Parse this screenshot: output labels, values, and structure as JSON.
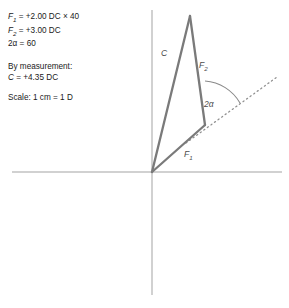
{
  "annotations": {
    "formulas": [
      {
        "id": "f1",
        "symbol": "F",
        "sub": "1",
        "text": " = +2.00 DC × 40"
      },
      {
        "id": "f2",
        "symbol": "F",
        "sub": "2",
        "text": " = +3.00 DC"
      },
      {
        "id": "twoalpha",
        "symbol": "2α",
        "sub": "",
        "text": " = 60"
      }
    ],
    "measurement": {
      "heading": "By measurement:",
      "symbol": "C",
      "text": " = +4.35 DC"
    },
    "scale": "Scale: 1 cm = 1 D"
  },
  "diagram": {
    "type": "vector-triangle",
    "labels": {
      "c": {
        "text": "C",
        "sub": "",
        "x": 161,
        "y": 56
      },
      "f2": {
        "text": "F",
        "sub": "2",
        "x": 199,
        "y": 68
      },
      "f1": {
        "text": "F",
        "sub": "1",
        "x": 184,
        "y": 157
      },
      "angle": {
        "text": "2α",
        "sub": "",
        "x": 204,
        "y": 107
      }
    },
    "axes": {
      "horizontal": {
        "x1": 12,
        "y1": 172,
        "x2": 282,
        "y2": 172
      },
      "vertical": {
        "x1": 152,
        "y1": 10,
        "x2": 152,
        "y2": 295
      },
      "color": "#a0a0a0"
    },
    "vertices": {
      "origin": {
        "x": 152,
        "y": 172
      },
      "apex": {
        "x": 190,
        "y": 16
      },
      "corner": {
        "x": 205,
        "y": 125
      }
    },
    "dotted_line": {
      "x1": 186,
      "y1": 143,
      "x2": 276,
      "y2": 78,
      "color": "#8c8c8c"
    },
    "arc": {
      "cx": 205,
      "cy": 125,
      "radius": 44,
      "start_deg": 90,
      "end_deg": 36
    },
    "vector_color": "#7a7a7a",
    "vector_width": 2.2
  }
}
